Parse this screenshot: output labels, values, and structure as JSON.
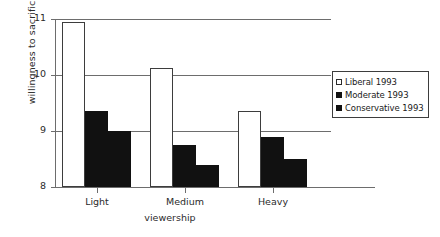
{
  "chart_data": {
    "type": "bar",
    "title": "",
    "subtitle": "",
    "xlabel": "viewership",
    "ylabel": "willingness to sacrifice",
    "categories": [
      "Light",
      "Medium",
      "Heavy"
    ],
    "series": [
      {
        "name": "Liberal 1993",
        "color": "#ffffff",
        "swatch": "sw-white",
        "values": [
          10.95,
          10.12,
          9.36
        ]
      },
      {
        "name": "Moderate 1993",
        "color": "#111111",
        "swatch": "sw-black",
        "values": [
          9.35,
          8.75,
          8.9
        ]
      },
      {
        "name": "Conservative 1993",
        "color": "#111111",
        "swatch": "sw-black",
        "values": [
          9.0,
          8.4,
          8.5
        ]
      }
    ],
    "ylim": [
      8,
      11
    ],
    "yticks": [
      8,
      9,
      10,
      11
    ],
    "ytick_labels": [
      "8",
      "9",
      "10",
      "11"
    ],
    "grid": true,
    "gridlines_at": [
      9,
      10,
      11
    ],
    "legend_position": "right"
  },
  "legend": {
    "entries": [
      {
        "label": "Liberal 1993"
      },
      {
        "label": "Moderate 1993"
      },
      {
        "label": "Conservative 1993"
      }
    ]
  },
  "axes": {
    "y_title": "willingness to sacrifice",
    "x_title": "viewership"
  }
}
